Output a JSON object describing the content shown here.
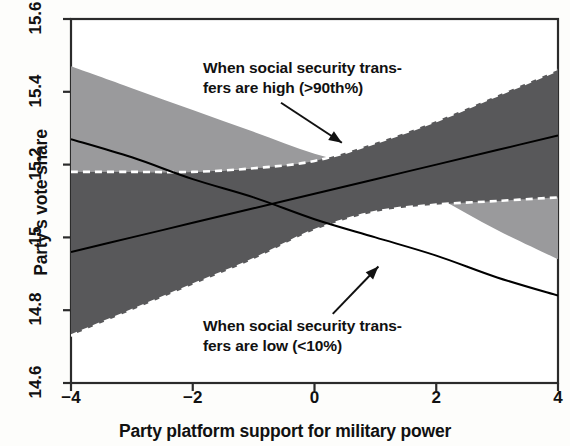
{
  "chart_data": {
    "type": "area",
    "title": "",
    "xlabel": "Party platform support for military power",
    "ylabel": "Party's vote share",
    "xlim": [
      -4,
      4
    ],
    "ylim": [
      14.6,
      15.6
    ],
    "xticks": [
      -4,
      -2,
      0,
      2,
      4
    ],
    "xtick_labels": [
      "−4",
      "−2",
      "0",
      "2",
      "4"
    ],
    "yticks": [
      14.6,
      14.8,
      15,
      15.2,
      15.4,
      15.6
    ],
    "ytick_labels": [
      "14.6",
      "14.8",
      "15",
      "15.2",
      "15.4",
      "15.6"
    ],
    "grid": false,
    "legend": "annotations",
    "x": [
      -4,
      -3,
      -2,
      -1,
      0,
      1,
      2,
      3,
      4
    ],
    "series": [
      {
        "name": "When social security transfers are high (>90th%)",
        "fill_color": "#58585a",
        "line_color": "#000000",
        "boundary_style": "dashed-white",
        "fit": [
          14.96,
          15.0,
          15.04,
          15.08,
          15.12,
          15.16,
          15.2,
          15.24,
          15.28
        ],
        "ci_upper": [
          15.18,
          15.18,
          15.18,
          15.19,
          15.21,
          15.26,
          15.32,
          15.39,
          15.46
        ],
        "ci_lower": [
          14.73,
          14.8,
          14.87,
          14.94,
          15.02,
          15.07,
          15.09,
          15.1,
          15.11
        ]
      },
      {
        "name": "When social security transfers are low (<10%)",
        "fill_color": "#9a9a9c",
        "line_color": "#000000",
        "boundary_style": "solid",
        "fit": [
          15.27,
          15.22,
          15.16,
          15.11,
          15.05,
          15.0,
          14.95,
          14.89,
          14.84
        ],
        "ci_upper": [
          15.47,
          15.41,
          15.35,
          15.29,
          15.23,
          15.19,
          15.16,
          15.13,
          15.11
        ],
        "ci_lower": [
          15.18,
          15.18,
          15.18,
          15.19,
          15.2,
          15.18,
          15.11,
          15.02,
          14.94
        ]
      }
    ],
    "annotations": [
      {
        "id": "high",
        "text": "When social security trans-\nfers are high (>90th%)",
        "arrow_from": [
          -0.55,
          15.37
        ],
        "arrow_to": [
          0.45,
          15.26
        ]
      },
      {
        "id": "low",
        "text": "When social security trans-\nfers are low (<10%)",
        "arrow_from": [
          0.3,
          14.79
        ],
        "arrow_to": [
          1.05,
          14.92
        ]
      }
    ]
  },
  "axis": {
    "x_title": "Party platform support for military power",
    "y_title": "Party's vote share"
  }
}
